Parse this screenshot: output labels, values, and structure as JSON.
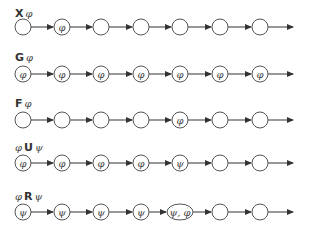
{
  "diagram": {
    "type": "LTL operator semantics on infinite paths",
    "rows": [
      {
        "label_prefix": "",
        "operator": "X",
        "label_suffix": "φ",
        "y": 27,
        "label_y": 17,
        "nodes": [
          "",
          "φ",
          "",
          "",
          "",
          "",
          ""
        ]
      },
      {
        "label_prefix": "",
        "operator": "G",
        "label_suffix": "φ",
        "y": 74,
        "label_y": 61,
        "nodes": [
          "φ",
          "φ",
          "φ",
          "φ",
          "φ",
          "φ",
          "φ"
        ]
      },
      {
        "label_prefix": "",
        "operator": "F",
        "label_suffix": "φ",
        "y": 120,
        "label_y": 107,
        "nodes": [
          "",
          "",
          "",
          "",
          "φ",
          "",
          ""
        ]
      },
      {
        "label_prefix": "φ",
        "operator": "U",
        "label_suffix": "ψ",
        "y": 163,
        "label_y": 151,
        "nodes": [
          "φ",
          "φ",
          "φ",
          "φ",
          "ψ",
          "",
          ""
        ]
      },
      {
        "label_prefix": "φ",
        "operator": "R",
        "label_suffix": "ψ",
        "y": 212,
        "label_y": 200,
        "nodes": [
          "ψ",
          "ψ",
          "ψ",
          "ψ",
          "ψ, φ",
          "",
          ""
        ]
      }
    ],
    "node_x": [
      23,
      62,
      101,
      141,
      180,
      220,
      260
    ],
    "arrow_end_x": 293,
    "colors": {
      "stroke": "#555555",
      "text": "#333333"
    }
  }
}
